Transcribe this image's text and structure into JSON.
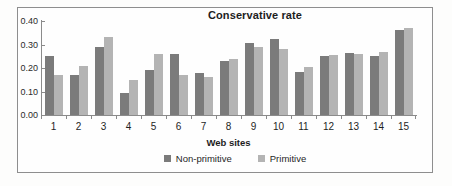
{
  "chart_data": {
    "type": "bar",
    "title": "Conservative rate",
    "xlabel": "Web sites",
    "ylabel": "",
    "ylim": [
      0.0,
      0.4
    ],
    "grid": false,
    "legend_position": "bottom",
    "categories": [
      "1",
      "2",
      "3",
      "4",
      "5",
      "6",
      "7",
      "8",
      "9",
      "10",
      "11",
      "12",
      "13",
      "14",
      "15"
    ],
    "ytick_labels": [
      "0.40",
      "0.30",
      "0.20",
      "0.10",
      "0.00"
    ],
    "ytick_values": [
      0.4,
      0.3,
      0.2,
      0.1,
      0.0
    ],
    "series": [
      {
        "name": "Non-primitive",
        "color": "#7b7b7b",
        "values": [
          0.25,
          0.17,
          0.29,
          0.095,
          0.19,
          0.26,
          0.18,
          0.23,
          0.305,
          0.325,
          0.185,
          0.25,
          0.265,
          0.25,
          0.36
        ]
      },
      {
        "name": "Primitive",
        "color": "#b4b4b4",
        "values": [
          0.17,
          0.21,
          0.33,
          0.15,
          0.26,
          0.17,
          0.16,
          0.24,
          0.29,
          0.28,
          0.205,
          0.255,
          0.26,
          0.27,
          0.37
        ]
      }
    ]
  }
}
